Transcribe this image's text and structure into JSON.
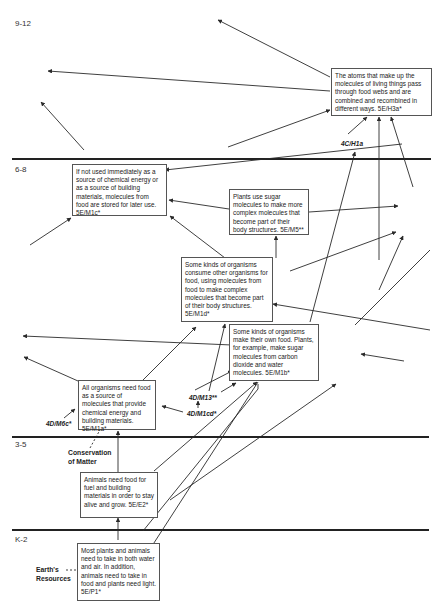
{
  "bands": [
    {
      "label": "9-12"
    },
    {
      "label": "6-8"
    },
    {
      "label": "3-5"
    },
    {
      "label": "K-2"
    }
  ],
  "boxes": {
    "h3a": {
      "text": "The atoms that make up the molecules of living things pass through food webs and are combined and recombined in different ways. 5E/H3a*"
    },
    "m1c": {
      "text": "If not used immediately as a source of chemical energy or as a source of building materials, molecules from food are stored for later use. 5E/M1c*"
    },
    "m5": {
      "text": "Plants use sugar molecules to make more complex molecules that become part of their body structures. 5E/M5**"
    },
    "m1d": {
      "text": "Some kinds of organisms consume other organisms for food, using molecules from food to make complex molecules that become part of their body structures. 5E/M1d*"
    },
    "m1b": {
      "text": "Some kinds of organisms make their own food. Plants, for example, make sugar molecules from carbon dioxide and water molecules.  5E/M1b*"
    },
    "m1a": {
      "text": "All organisms need food as a source of molecules that provide chemical energy and building materials. 5E/M1a*"
    },
    "e2": {
      "text": "Animals need food for fuel and building materials in order to stay alive and grow. 5E/E2*"
    },
    "p1": {
      "text": "Most plants and animals need to take in both water and air. In addition, animals need to take in food and plants need light. 5E/P1*"
    }
  },
  "references": {
    "h1a": "4C/H1a",
    "m13": "4D/M13**",
    "m1cd": "4D/M1cd*",
    "m6c": "4D/M6c*"
  },
  "side_labels": {
    "conservation": "Conservation of Matter",
    "earths_resources": "Earth's Resources"
  },
  "colors": {
    "line": "#2a2a2a",
    "band_divider": "#222222",
    "box_border": "#555555"
  }
}
